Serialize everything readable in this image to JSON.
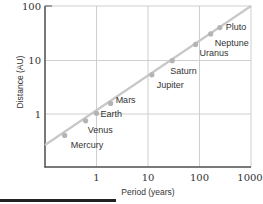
{
  "chart_data": {
    "type": "line",
    "title": "",
    "xlabel": "Period (years)",
    "ylabel": "Distance (AU)",
    "xscale": "log",
    "yscale": "log",
    "xlim": [
      0.1,
      1000
    ],
    "ylim": [
      0.1,
      100
    ],
    "x_ticks": [
      "1",
      "10",
      "100",
      "1000"
    ],
    "y_ticks": [
      "1",
      "10",
      "100"
    ],
    "grid": true,
    "series": [
      {
        "name": "Planets",
        "points": [
          {
            "label": "Mercury",
            "period": 0.241,
            "distance": 0.387
          },
          {
            "label": "Venus",
            "period": 0.615,
            "distance": 0.723
          },
          {
            "label": "Earth",
            "period": 1.0,
            "distance": 1.0
          },
          {
            "label": "Mars",
            "period": 1.881,
            "distance": 1.524
          },
          {
            "label": "Jupiter",
            "period": 11.86,
            "distance": 5.2
          },
          {
            "label": "Saturn",
            "period": 29.46,
            "distance": 9.54
          },
          {
            "label": "Uranus",
            "period": 84.01,
            "distance": 19.19
          },
          {
            "label": "Neptune",
            "period": 164.8,
            "distance": 30.07
          },
          {
            "label": "Pluto",
            "period": 248.0,
            "distance": 39.48
          }
        ]
      }
    ],
    "fit_line": {
      "relation": "distance = period^(2/3)"
    },
    "colors": {
      "line": "#c8c8c8",
      "marker": "#b4b4b4",
      "axis": "#555555",
      "grid": "#cfcfcf"
    }
  }
}
